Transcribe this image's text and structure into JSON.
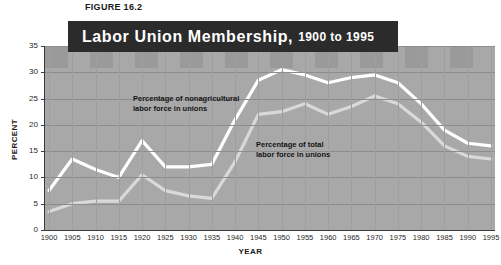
{
  "figure": {
    "label": "FIGURE 16.2",
    "title_main": "Labor Union Membership,",
    "title_sub": "1900 to 1995"
  },
  "annotations": {
    "nonagricultural_line1": "Percentage of nonagricultural",
    "nonagricultural_line2": "labor force in unions",
    "total_line1": "Percentage of total",
    "total_line2": "labor force in unions"
  },
  "axis": {
    "ylabel": "PERCENT",
    "xlabel": "YEAR"
  },
  "colors": {
    "title_bar": "#2b2b2b",
    "plot_background": "#a8a8a8",
    "band": "#9a9a9a",
    "gridline": "#8c8c8c",
    "series_nonagricultural": "#ffffff",
    "series_total": "#d9d9d9"
  },
  "chart_data": {
    "type": "line",
    "title": "Labor Union Membership, 1900 to 1995",
    "xlabel": "YEAR",
    "ylabel": "PERCENT",
    "xlim": [
      1900,
      1995
    ],
    "ylim": [
      0,
      35
    ],
    "yticks": [
      0,
      5,
      10,
      15,
      20,
      25,
      30,
      35
    ],
    "grid": true,
    "legend": "inline-annotations",
    "x": [
      1900,
      1905,
      1910,
      1915,
      1920,
      1925,
      1930,
      1935,
      1940,
      1945,
      1950,
      1955,
      1960,
      1965,
      1970,
      1975,
      1980,
      1985,
      1990,
      1995
    ],
    "categories": [
      "1900",
      "1905",
      "1910",
      "1915",
      "1920",
      "1925",
      "1930",
      "1935",
      "1940",
      "1945",
      "1950",
      "1955",
      "1960",
      "1965",
      "1970",
      "1975",
      "1980",
      "1985",
      "1990",
      "1995"
    ],
    "series": [
      {
        "name": "Percentage of nonagricultural labor force in unions",
        "color": "#ffffff",
        "values": [
          7.5,
          13.5,
          11.5,
          10.0,
          17.0,
          12.0,
          12.0,
          12.5,
          21.0,
          28.5,
          30.5,
          29.5,
          28.0,
          29.0,
          29.5,
          28.0,
          24.0,
          19.0,
          16.5,
          16.0
        ]
      },
      {
        "name": "Percentage of total labor force in unions",
        "color": "#d9d9d9",
        "values": [
          3.5,
          5.0,
          5.5,
          5.5,
          10.5,
          7.5,
          6.5,
          6.0,
          13.0,
          22.0,
          22.5,
          24.0,
          22.0,
          23.5,
          25.5,
          24.0,
          20.5,
          16.0,
          14.0,
          13.5
        ]
      }
    ]
  }
}
